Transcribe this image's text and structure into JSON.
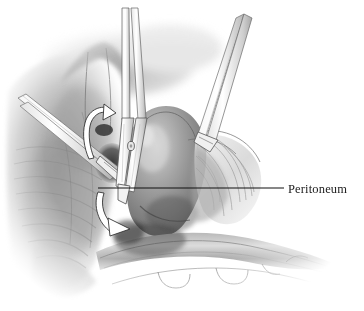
{
  "figure": {
    "name": "peritoneum-dissection-illustration",
    "type": "medical-line-and-tone-illustration",
    "background_color": "#ffffff",
    "width": 364,
    "height": 311,
    "style": "graphite pencil / halftone surgical atlas drawing, grayscale"
  },
  "labels": [
    {
      "id": "peritoneum",
      "text": "Peritoneum",
      "text_x": 288,
      "text_y": 183,
      "color": "#1b1b1b",
      "leader_line": {
        "from_x": 98,
        "from_y": 188,
        "to_x": 284,
        "to_y": 188,
        "color": "#111111",
        "width": 1.1
      }
    }
  ],
  "annotations": {
    "arrows": [
      {
        "id": "upper-curved-arrow",
        "description": "white curved arrow sweeping left then down at dissection plane",
        "fill": "#ffffff",
        "stroke": "#2a2a2a"
      },
      {
        "id": "lower-curved-arrow",
        "description": "white curved arrow pointing down and right beneath the sac",
        "fill": "#ffffff",
        "stroke": "#2a2a2a"
      }
    ]
  },
  "anatomy": [
    {
      "id": "abdominal-wall-muscle-left",
      "label": "striated muscle / abdominal wall",
      "tone": "#8d8d8d"
    },
    {
      "id": "hernia-sac",
      "label": "rounded hernia sac",
      "tone": "#787878"
    },
    {
      "id": "peritoneal-membrane",
      "label": "translucent peritoneal membrane with fine fibers",
      "tone": "#a8a8a8"
    },
    {
      "id": "spermatic-cord",
      "label": "cord structure crossing lower field",
      "tone": "#9a9a9a"
    }
  ],
  "instruments": [
    {
      "id": "left-grasper",
      "label": "grasping forceps entering from upper left",
      "fill": "#fbfbfb",
      "stroke": "#6e6e6e"
    },
    {
      "id": "center-scissors",
      "label": "dissecting scissors entering from top center",
      "fill": "#fcfcfc",
      "stroke": "#5e5e5e"
    },
    {
      "id": "right-grasper",
      "label": "grasping forceps entering from upper right retracting peritoneum",
      "fill": "#fcfcfc",
      "stroke": "#6e6e6e"
    }
  ]
}
